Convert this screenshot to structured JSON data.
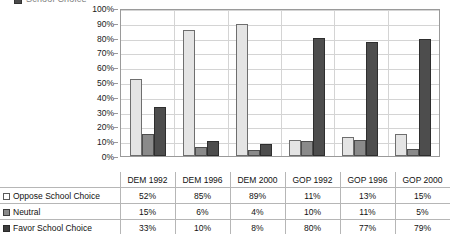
{
  "title": {
    "text": "School Choice",
    "swatch_name": "legend-swatch-icon"
  },
  "chart_data": {
    "type": "bar",
    "title": "School Choice",
    "xlabel": "",
    "ylabel": "",
    "ylim": [
      0,
      100
    ],
    "grid": true,
    "legend_position": "table-row-labels",
    "categories": [
      "DEM 1992",
      "DEM 1996",
      "DEM 2000",
      "GOP 1992",
      "GOP 1996",
      "GOP 2000"
    ],
    "ytick_labels": [
      "100%",
      "90%",
      "80%",
      "70%",
      "60%",
      "50%",
      "40%",
      "30%",
      "20%",
      "10%",
      "0%"
    ],
    "ytick_values": [
      100,
      90,
      80,
      70,
      60,
      50,
      40,
      30,
      20,
      10,
      0
    ],
    "series": [
      {
        "name": "Oppose School Choice",
        "color": "#e4e4e4",
        "values": [
          52,
          85,
          89,
          11,
          13,
          15
        ],
        "labels": [
          "52%",
          "85%",
          "89%",
          "11%",
          "13%",
          "15%"
        ]
      },
      {
        "name": "Neutral",
        "color": "#8a8a8a",
        "values": [
          15,
          6,
          4,
          10,
          11,
          5
        ],
        "labels": [
          "15%",
          "6%",
          "4%",
          "10%",
          "11%",
          "5%"
        ]
      },
      {
        "name": "Favor School Choice",
        "color": "#4d4d4d",
        "values": [
          33,
          10,
          8,
          80,
          77,
          79
        ],
        "labels": [
          "33%",
          "10%",
          "8%",
          "80%",
          "77%",
          "79%"
        ]
      }
    ]
  },
  "table": {
    "corner_label": "",
    "column_headers": [
      "DEM 1992",
      "DEM 1996",
      "DEM 2000",
      "GOP 1992",
      "GOP 1996",
      "GOP 2000"
    ],
    "rows": [
      {
        "label": "Oppose School Choice",
        "values": [
          "52%",
          "85%",
          "89%",
          "11%",
          "13%",
          "15%"
        ]
      },
      {
        "label": "Neutral",
        "values": [
          "15%",
          "6%",
          "4%",
          "10%",
          "11%",
          "5%"
        ]
      },
      {
        "label": "Favor School Choice",
        "values": [
          "33%",
          "10%",
          "8%",
          "80%",
          "77%",
          "79%"
        ]
      }
    ]
  }
}
